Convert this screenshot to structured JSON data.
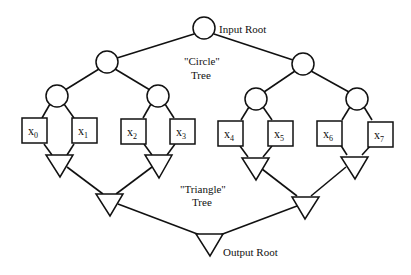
{
  "diagram": {
    "labels": {
      "input_root": "Input Root",
      "circle_tree_line1": "\"Circle\"",
      "circle_tree_line2": "Tree",
      "triangle_tree_line1": "\"Triangle\"",
      "triangle_tree_line2": "Tree",
      "output_root": "Output Root"
    },
    "leaves": [
      {
        "base": "x",
        "sub": "0"
      },
      {
        "base": "x",
        "sub": "1"
      },
      {
        "base": "x",
        "sub": "2"
      },
      {
        "base": "x",
        "sub": "3"
      },
      {
        "base": "x",
        "sub": "4"
      },
      {
        "base": "x",
        "sub": "5"
      },
      {
        "base": "x",
        "sub": "6"
      },
      {
        "base": "x",
        "sub": "7"
      }
    ],
    "colors": {
      "stroke": "#111111",
      "background": "#ffffff"
    }
  }
}
